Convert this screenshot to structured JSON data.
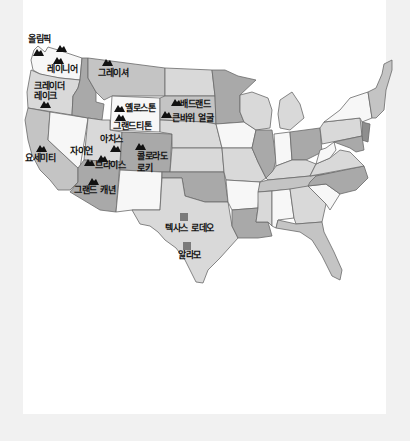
{
  "map": {
    "title": "",
    "colors": {
      "background": "#f1f1f1",
      "content": "#ffffff",
      "state_light": "#d9d9d9",
      "state_mid": "#c4c4c4",
      "state_dark": "#a9a9a9",
      "state_white": "#f7f7f7",
      "marker": "#7a7a7a"
    },
    "parks": [
      {
        "id": "olympic",
        "label": "올림픽",
        "icon": "mountain-icon"
      },
      {
        "id": "rainier",
        "label": "레이니어",
        "icon": "mountain-icon"
      },
      {
        "id": "crater-lake",
        "label_line1": "크레이더",
        "label_line2": "레이크",
        "icon": "mountain-icon"
      },
      {
        "id": "glacier",
        "label": "그레이셔",
        "icon": "mountain-icon"
      },
      {
        "id": "yellowstone",
        "label": "옐로스톤",
        "icon": "mountain-icon"
      },
      {
        "id": "grand-teton",
        "label": "그랜드티톤",
        "icon": "mountain-icon"
      },
      {
        "id": "badlands",
        "label": "배드랜드",
        "icon": "mountain-icon"
      },
      {
        "id": "mount-rushmore",
        "label": "큰바위 얼굴",
        "icon": "mountain-icon"
      },
      {
        "id": "arches",
        "label": "아치스",
        "icon": "mountain-icon"
      },
      {
        "id": "colorado-rockies",
        "label_line1": "콜로라도",
        "label_line2": "로키",
        "icon": "mountain-icon"
      },
      {
        "id": "zion",
        "label": "자이언",
        "icon": "mountain-icon"
      },
      {
        "id": "bryce",
        "label": "브라이스",
        "icon": "mountain-icon"
      },
      {
        "id": "yosemite",
        "label": "요세미티",
        "icon": "mountain-icon"
      },
      {
        "id": "grand-canyon",
        "label": "그랜드 캐년",
        "icon": "mountain-icon"
      }
    ],
    "landmarks": [
      {
        "id": "texas-rodeo",
        "label": "텍사스 로데오",
        "icon": "square-marker-icon"
      },
      {
        "id": "alamo",
        "label": "알라모",
        "icon": "square-marker-icon"
      }
    ]
  }
}
